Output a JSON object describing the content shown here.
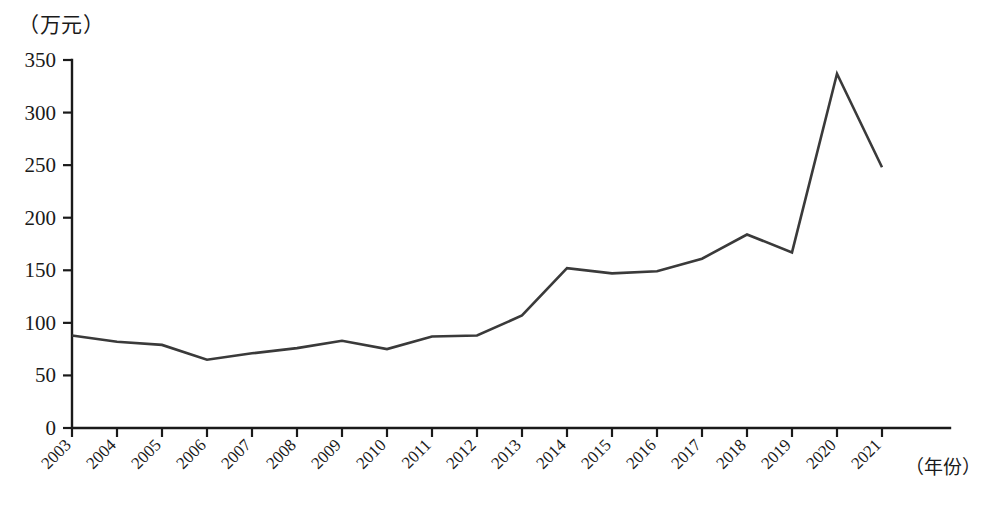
{
  "chart_data": {
    "type": "line",
    "title": "",
    "subtitle": "",
    "xlabel": "（年份）",
    "ylabel": "（万元）",
    "categories": [
      "2003",
      "2004",
      "2005",
      "2006",
      "2007",
      "2008",
      "2009",
      "2010",
      "2011",
      "2012",
      "2013",
      "2014",
      "2015",
      "2016",
      "2017",
      "2018",
      "2019",
      "2020",
      "2021"
    ],
    "series": [
      {
        "name": "",
        "values": [
          88,
          82,
          79,
          65,
          71,
          76,
          83,
          75,
          87,
          88,
          107,
          152,
          147,
          149,
          161,
          184,
          167,
          337,
          248
        ]
      }
    ],
    "ylim": [
      0,
      350
    ],
    "yticks": [
      "0",
      "50",
      "100",
      "150",
      "200",
      "250",
      "300",
      "350"
    ],
    "ytick_values": [
      0,
      50,
      100,
      150,
      200,
      250,
      300,
      350
    ],
    "grid": false,
    "legend": "none",
    "line_color": "#3a3a3a",
    "axis_color": "#1a1a1a"
  },
  "axes": {
    "y_unit_label": "（万元）",
    "x_unit_label": "（年份）"
  }
}
